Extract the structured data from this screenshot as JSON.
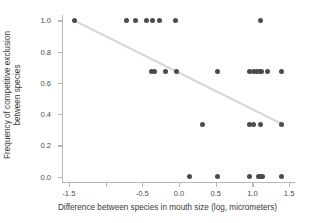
{
  "chart_data": {
    "type": "scatter",
    "title": "",
    "xlabel": "Difference between species in mouth size (log, micrometers)",
    "ylabel_line1": "Frequency of competitive exclusion",
    "ylabel_line2": "between species",
    "xlim": [
      -1.58,
      1.58
    ],
    "ylim": [
      -0.035,
      1.035
    ],
    "xticks": [
      -1.5,
      -1.0,
      -0.5,
      0.0,
      0.5,
      1.0,
      1.5
    ],
    "xtick_labels": [
      "-1.5",
      "",
      "-0.5",
      "0.0",
      "0.5",
      "1.0",
      "1.5"
    ],
    "yticks": [
      0.0,
      0.2,
      0.4,
      0.6,
      0.8,
      1.0
    ],
    "ytick_labels": [
      "0.0",
      "0.2",
      "0.4",
      "0.6",
      "0.8",
      "1.0"
    ],
    "grid": false,
    "legend": "none",
    "point_color": "#4b4b4b",
    "line_color": "#d8d8d8",
    "axis_color": "#b9b9b9",
    "trend_line": {
      "x0": -1.43,
      "y0": 1.0,
      "x1": 1.41,
      "y1": 0.335
    },
    "points": [
      {
        "x": -1.43,
        "y": 1.0
      },
      {
        "x": -0.72,
        "y": 1.0
      },
      {
        "x": -0.59,
        "y": 1.0
      },
      {
        "x": -0.44,
        "y": 1.0
      },
      {
        "x": -0.36,
        "y": 1.0
      },
      {
        "x": -0.26,
        "y": 1.0
      },
      {
        "x": -0.05,
        "y": 1.0
      },
      {
        "x": 1.11,
        "y": 1.0
      },
      {
        "x": -0.38,
        "y": 0.67
      },
      {
        "x": -0.34,
        "y": 0.67
      },
      {
        "x": -0.19,
        "y": 0.67
      },
      {
        "x": -0.04,
        "y": 0.67
      },
      {
        "x": 0.52,
        "y": 0.67
      },
      {
        "x": 0.96,
        "y": 0.67
      },
      {
        "x": 1.02,
        "y": 0.67
      },
      {
        "x": 1.06,
        "y": 0.67
      },
      {
        "x": 1.09,
        "y": 0.67
      },
      {
        "x": 1.12,
        "y": 0.67
      },
      {
        "x": 1.2,
        "y": 0.67
      },
      {
        "x": 1.4,
        "y": 0.67
      },
      {
        "x": 0.32,
        "y": 0.335
      },
      {
        "x": 0.96,
        "y": 0.335
      },
      {
        "x": 1.01,
        "y": 0.335
      },
      {
        "x": 1.11,
        "y": 0.335
      },
      {
        "x": 1.4,
        "y": 0.335
      },
      {
        "x": 0.14,
        "y": 0.0
      },
      {
        "x": 0.53,
        "y": 0.0
      },
      {
        "x": 0.96,
        "y": 0.0
      },
      {
        "x": 1.08,
        "y": 0.0
      },
      {
        "x": 1.11,
        "y": 0.0
      },
      {
        "x": 1.14,
        "y": 0.0
      },
      {
        "x": 1.4,
        "y": 0.0
      }
    ]
  }
}
